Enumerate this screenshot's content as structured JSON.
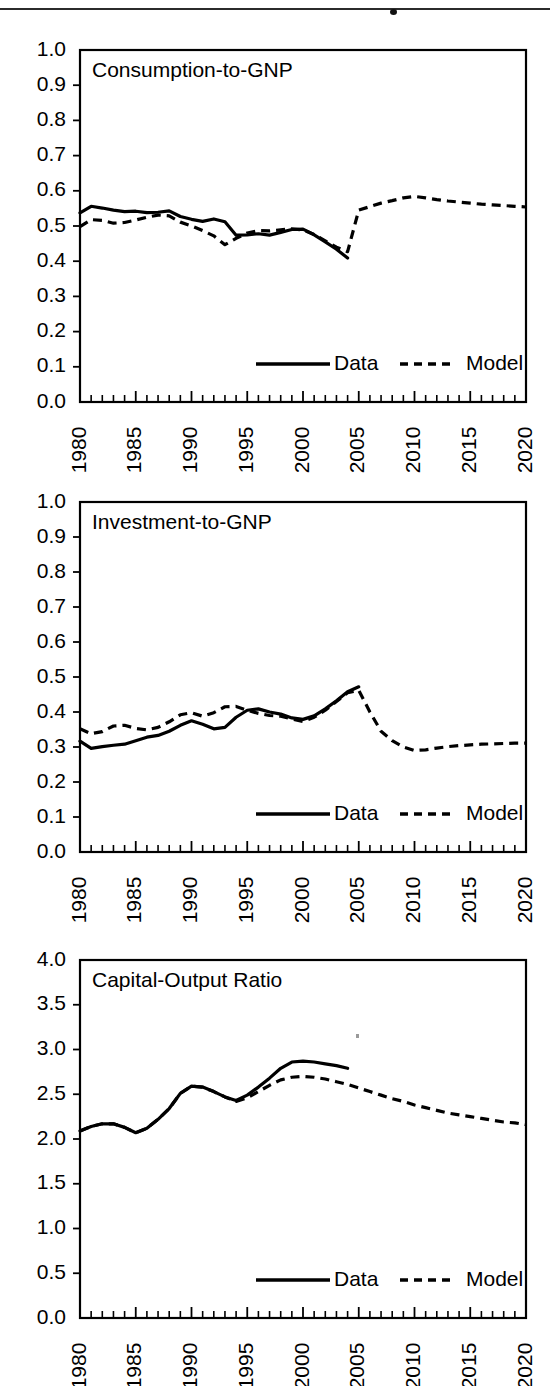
{
  "page": {
    "width": 550,
    "height": 1386,
    "background": "#ffffff",
    "ink_color": "#000000",
    "top_rule": {
      "present": true,
      "label": "horizontal-rule"
    }
  },
  "legend": {
    "data_label": "Data",
    "model_label": "Model",
    "data_style": "solid",
    "model_style": "dashed",
    "position": "bottom-right-inside"
  },
  "axis": {
    "x_tick_labels": [
      "1980",
      "1985",
      "1990",
      "1995",
      "2000",
      "2005",
      "2010",
      "2015",
      "2020"
    ],
    "x_major_values": [
      1980,
      1985,
      1990,
      1995,
      2000,
      2005,
      2010,
      2015,
      2020
    ],
    "x_minor_step": 1,
    "xlim": [
      1980,
      2020
    ],
    "x_label_orientation": "vertical"
  },
  "chart_data": [
    {
      "id": "consumption-to-gnp",
      "type": "line",
      "title": "Consumption-to-GNP",
      "xlabel": "",
      "ylabel": "",
      "xlim": [
        1980,
        2020
      ],
      "ylim": [
        0.0,
        1.0
      ],
      "ytick_labels": [
        "0.0",
        "0.1",
        "0.2",
        "0.3",
        "0.4",
        "0.5",
        "0.6",
        "0.7",
        "0.8",
        "0.9",
        "1.0"
      ],
      "ytick_values": [
        0.0,
        0.1,
        0.2,
        0.3,
        0.4,
        0.5,
        0.6,
        0.7,
        0.8,
        0.9,
        1.0
      ],
      "grid": false,
      "legend": [
        "Data",
        "Model"
      ],
      "series": [
        {
          "name": "Data",
          "style": "solid",
          "x": [
            1980,
            1981,
            1982,
            1983,
            1984,
            1985,
            1986,
            1987,
            1988,
            1989,
            1990,
            1991,
            1992,
            1993,
            1994,
            1995,
            1996,
            1997,
            1998,
            1999,
            2000,
            2001,
            2002,
            2003,
            2004
          ],
          "values": [
            0.537,
            0.556,
            0.551,
            0.545,
            0.541,
            0.542,
            0.538,
            0.539,
            0.543,
            0.527,
            0.519,
            0.513,
            0.52,
            0.512,
            0.474,
            0.475,
            0.478,
            0.474,
            0.482,
            0.49,
            0.491,
            0.475,
            0.455,
            0.434,
            0.409
          ]
        },
        {
          "name": "Model",
          "style": "dashed",
          "x": [
            1980,
            1981,
            1982,
            1983,
            1984,
            1985,
            1986,
            1987,
            1988,
            1989,
            1990,
            1991,
            1992,
            1993,
            1994,
            1995,
            1996,
            1997,
            1998,
            1999,
            2000,
            2001,
            2002,
            2003,
            2004,
            2005,
            2006,
            2007,
            2008,
            2009,
            2010,
            2011,
            2012,
            2013,
            2014,
            2015,
            2016,
            2017,
            2018,
            2019,
            2020
          ],
          "values": [
            0.498,
            0.518,
            0.516,
            0.508,
            0.51,
            0.517,
            0.525,
            0.531,
            0.529,
            0.511,
            0.5,
            0.487,
            0.472,
            0.447,
            0.465,
            0.48,
            0.487,
            0.486,
            0.489,
            0.492,
            0.489,
            0.476,
            0.458,
            0.44,
            0.427,
            0.545,
            0.555,
            0.565,
            0.572,
            0.58,
            0.584,
            0.58,
            0.575,
            0.571,
            0.568,
            0.565,
            0.562,
            0.56,
            0.558,
            0.556,
            0.554
          ]
        }
      ]
    },
    {
      "id": "investment-to-gnp",
      "type": "line",
      "title": "Investment-to-GNP",
      "xlabel": "",
      "ylabel": "",
      "xlim": [
        1980,
        2020
      ],
      "ylim": [
        0.0,
        1.0
      ],
      "ytick_labels": [
        "0.0",
        "0.1",
        "0.2",
        "0.3",
        "0.4",
        "0.5",
        "0.6",
        "0.7",
        "0.8",
        "0.9",
        "1.0"
      ],
      "ytick_values": [
        0.0,
        0.1,
        0.2,
        0.3,
        0.4,
        0.5,
        0.6,
        0.7,
        0.8,
        0.9,
        1.0
      ],
      "grid": false,
      "legend": [
        "Data",
        "Model"
      ],
      "series": [
        {
          "name": "Data",
          "style": "solid",
          "x": [
            1980,
            1981,
            1982,
            1983,
            1984,
            1985,
            1986,
            1987,
            1988,
            1989,
            1990,
            1991,
            1992,
            1993,
            1994,
            1995,
            1996,
            1997,
            1998,
            1999,
            2000,
            2001,
            2002,
            2003,
            2004,
            2005
          ],
          "values": [
            0.317,
            0.296,
            0.301,
            0.305,
            0.308,
            0.318,
            0.328,
            0.333,
            0.345,
            0.362,
            0.375,
            0.365,
            0.352,
            0.356,
            0.385,
            0.405,
            0.409,
            0.4,
            0.394,
            0.383,
            0.379,
            0.389,
            0.409,
            0.432,
            0.458,
            0.472
          ]
        },
        {
          "name": "Model",
          "style": "dashed",
          "x": [
            1980,
            1981,
            1982,
            1983,
            1984,
            1985,
            1986,
            1987,
            1988,
            1989,
            1990,
            1991,
            1992,
            1993,
            1994,
            1995,
            1996,
            1997,
            1998,
            1999,
            2000,
            2001,
            2002,
            2003,
            2004,
            2005,
            2006,
            2007,
            2008,
            2009,
            2010,
            2011,
            2012,
            2013,
            2014,
            2015,
            2016,
            2017,
            2018,
            2019,
            2020
          ],
          "values": [
            0.352,
            0.338,
            0.344,
            0.36,
            0.362,
            0.353,
            0.349,
            0.356,
            0.372,
            0.392,
            0.398,
            0.388,
            0.398,
            0.415,
            0.416,
            0.405,
            0.396,
            0.39,
            0.388,
            0.38,
            0.373,
            0.385,
            0.405,
            0.43,
            0.455,
            0.462,
            0.4,
            0.345,
            0.318,
            0.3,
            0.29,
            0.292,
            0.297,
            0.301,
            0.304,
            0.306,
            0.308,
            0.309,
            0.31,
            0.311,
            0.311
          ]
        }
      ]
    },
    {
      "id": "capital-output-ratio",
      "type": "line",
      "title": "Capital-Output Ratio",
      "xlabel": "",
      "ylabel": "",
      "xlim": [
        1980,
        2020
      ],
      "ylim": [
        0.0,
        4.0
      ],
      "ytick_labels": [
        "0.0",
        "0.5",
        "1.0",
        "1.5",
        "2.0",
        "2.5",
        "3.0",
        "3.5",
        "4.0"
      ],
      "ytick_values": [
        0.0,
        0.5,
        1.0,
        1.5,
        2.0,
        2.5,
        3.0,
        3.5,
        4.0
      ],
      "grid": false,
      "legend": [
        "Data",
        "Model"
      ],
      "series": [
        {
          "name": "Data",
          "style": "solid",
          "x": [
            1980,
            1981,
            1982,
            1983,
            1984,
            1985,
            1986,
            1987,
            1988,
            1989,
            1990,
            1991,
            1992,
            1993,
            1994,
            1995,
            1996,
            1997,
            1998,
            1999,
            2000,
            2001,
            2002,
            2003,
            2004
          ],
          "values": [
            2.09,
            2.14,
            2.17,
            2.17,
            2.13,
            2.07,
            2.12,
            2.22,
            2.34,
            2.51,
            2.59,
            2.58,
            2.53,
            2.47,
            2.43,
            2.49,
            2.58,
            2.68,
            2.79,
            2.86,
            2.87,
            2.86,
            2.84,
            2.82,
            2.79
          ]
        },
        {
          "name": "Model",
          "style": "dashed",
          "x": [
            1980,
            1981,
            1982,
            1983,
            1984,
            1985,
            1986,
            1987,
            1988,
            1989,
            1990,
            1991,
            1992,
            1993,
            1994,
            1995,
            1996,
            1997,
            1998,
            1999,
            2000,
            2001,
            2002,
            2003,
            2004,
            2005,
            2006,
            2007,
            2008,
            2009,
            2010,
            2011,
            2012,
            2013,
            2014,
            2015,
            2016,
            2017,
            2018,
            2019,
            2020
          ],
          "values": [
            2.09,
            2.14,
            2.17,
            2.17,
            2.13,
            2.07,
            2.12,
            2.22,
            2.34,
            2.51,
            2.59,
            2.58,
            2.53,
            2.47,
            2.42,
            2.46,
            2.53,
            2.6,
            2.66,
            2.69,
            2.7,
            2.69,
            2.67,
            2.64,
            2.61,
            2.57,
            2.53,
            2.49,
            2.45,
            2.42,
            2.38,
            2.35,
            2.32,
            2.29,
            2.27,
            2.25,
            2.23,
            2.21,
            2.19,
            2.18,
            2.16
          ]
        }
      ]
    }
  ]
}
